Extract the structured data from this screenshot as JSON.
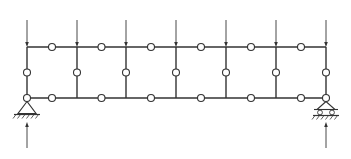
{
  "diagram": {
    "type": "structural-frame",
    "colors": {
      "line": "#333333",
      "background": "#ffffff",
      "hinge_fill": "#ffffff"
    },
    "geometry": {
      "top_chord_y": 47,
      "bottom_chord_y": 98,
      "column_x": [
        27,
        77,
        126,
        176,
        226,
        276,
        326
      ],
      "hinge_radius": 3.5
    },
    "loads": {
      "count": 7,
      "direction": "down",
      "from_y": 20,
      "to_y": 47
    },
    "supports": [
      {
        "name": "left-support",
        "type": "pin",
        "x": 27
      },
      {
        "name": "right-support",
        "type": "roller",
        "x": 326
      }
    ],
    "reactions": {
      "direction": "up",
      "from_y": 148,
      "to_y": 122
    }
  }
}
